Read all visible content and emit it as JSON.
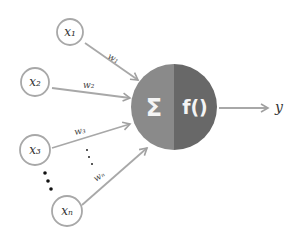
{
  "diagram": {
    "inputs": [
      {
        "id": "x1",
        "label": "x₁",
        "weight": "w₁"
      },
      {
        "id": "x2",
        "label": "x₂",
        "weight": "w₂"
      },
      {
        "id": "x3",
        "label": "x₃",
        "weight": "w₃"
      },
      {
        "id": "xn",
        "label": "xₙ",
        "weight": "wₙ"
      }
    ],
    "ellipsis_inputs": "⋮",
    "ellipsis_weights": "⋮",
    "neuron": {
      "sum_symbol": "Σ",
      "activation": "f()",
      "left_color": "#8a8a8a",
      "right_color": "#686868"
    },
    "output": {
      "label": "y"
    },
    "colors": {
      "node_stroke": "#a8a8a8",
      "arrow": "#a0a0a0",
      "text": "#333333"
    }
  }
}
